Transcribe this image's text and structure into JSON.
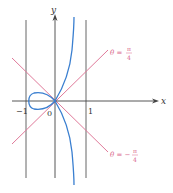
{
  "diagram": {
    "axes": {
      "x_label": "x",
      "y_label": "y",
      "origin_label": "0",
      "tick_left": "−1",
      "tick_right": "1"
    },
    "asymptote_labels": {
      "upper": {
        "lhs": "θ =",
        "num": "π",
        "den": "4"
      },
      "lower": {
        "lhs": "θ = −",
        "num": "π",
        "den": "4"
      }
    },
    "colors": {
      "axis": "#444444",
      "vertical_lines": "#555555",
      "tangent_lines": "#e07a9a",
      "curve": "#3a7fd0",
      "label_pink": "#d9668a"
    }
  }
}
